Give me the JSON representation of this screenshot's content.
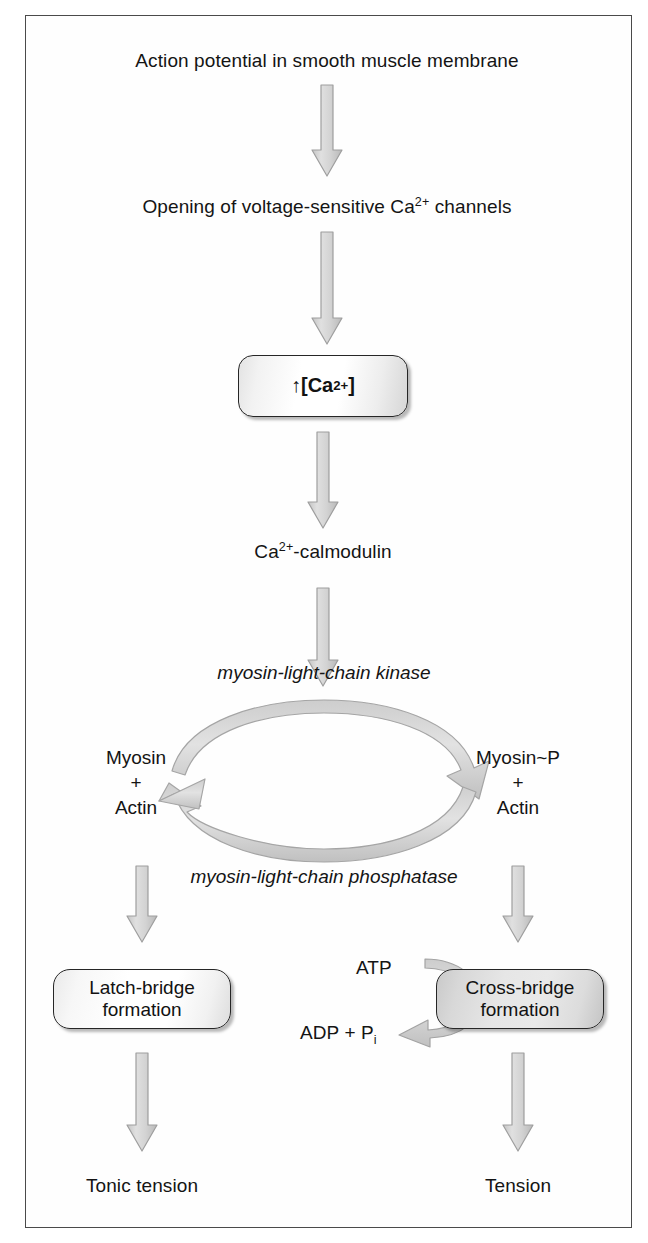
{
  "figure": {
    "border_color": "#4a4a4a",
    "arrow_fill": "#d2d2d2",
    "arrow_stroke": "#9a9a9a"
  },
  "steps": {
    "action_potential": "Action potential in smooth muscle membrane",
    "channel_opening_pre": "Opening of voltage-sensitive Ca",
    "channel_opening_sup": "2+",
    "channel_opening_post": " channels",
    "calcium_box_arrow": "↑",
    "calcium_box_pre": " [Ca",
    "calcium_box_sup": "2+",
    "calcium_box_post": "]",
    "calmodulin_pre": "Ca",
    "calmodulin_sup": "2+",
    "calmodulin_post": "-calmodulin"
  },
  "cycle": {
    "kinase_label": "myosin-light-chain kinase",
    "phosphatase_label": "myosin-light-chain phosphatase",
    "left_node_line1": "Myosin",
    "left_node_line2": "+",
    "left_node_line3": "Actin",
    "right_node_line1": "Myosin~P",
    "right_node_line2": "+",
    "right_node_line3": "Actin"
  },
  "outcomes": {
    "latch_line1": "Latch-bridge",
    "latch_line2": "formation",
    "cross_line1": "Cross-bridge",
    "cross_line2": "formation",
    "tonic_tension": "Tonic tension",
    "tension": "Tension"
  },
  "energetics": {
    "atp": "ATP",
    "adp_pre": "ADP + P",
    "adp_sub": "i"
  }
}
